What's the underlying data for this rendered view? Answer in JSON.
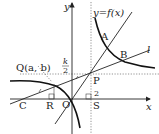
{
  "diagram": {
    "axes": {
      "x_label": "x",
      "y_label": "y",
      "origin_label": "O"
    },
    "curve_label": "y=f(x)",
    "line_label": "l",
    "points": {
      "A": "A",
      "B": "B",
      "C": "C",
      "P": "P",
      "Q": "Q(a, b)",
      "R": "R",
      "S": "S"
    },
    "tick_labels": {
      "k_over_2_num": "k",
      "k_over_2_den": "2",
      "x_two": "2"
    },
    "colors": {
      "ink": "#222222",
      "guide": "#777777"
    }
  }
}
